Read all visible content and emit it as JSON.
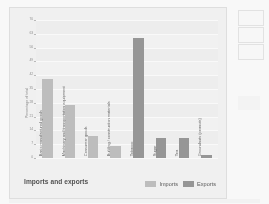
{
  "chart_data": {
    "type": "bar",
    "title": "Imports and exports",
    "xlabel": "",
    "ylabel": "Percentage of total",
    "ylim": [
      0,
      70
    ],
    "yticks": [
      0,
      7,
      14,
      21,
      28,
      35,
      42,
      49,
      56,
      63,
      70
    ],
    "grid": true,
    "legend_position": "bottom-right",
    "categories": [
      "Basic manufactured goods",
      "Machinery and transportation equipment",
      "Consumer goods",
      "Building / construction materials",
      "Tobacco",
      "Sugar",
      "Tea",
      "Groundnuts (peanuts)"
    ],
    "series": [
      {
        "name": "Imports",
        "color": "#b9b9b9",
        "values": [
          40,
          27,
          11,
          6,
          0,
          0,
          0,
          0
        ]
      },
      {
        "name": "Exports",
        "color": "#8d8d8d",
        "values": [
          0,
          0,
          0,
          0,
          61,
          10,
          10,
          1.5
        ]
      }
    ],
    "bars": [
      {
        "category": "Basic manufactured goods",
        "series": "Imports",
        "value": 40
      },
      {
        "category": "Machinery and transportation equipment",
        "series": "Imports",
        "value": 27
      },
      {
        "category": "Consumer goods",
        "series": "Imports",
        "value": 11
      },
      {
        "category": "Building / construction materials",
        "series": "Imports",
        "value": 6
      },
      {
        "category": "Tobacco",
        "series": "Exports",
        "value": 61
      },
      {
        "category": "Sugar",
        "series": "Exports",
        "value": 10
      },
      {
        "category": "Tea",
        "series": "Exports",
        "value": 10
      },
      {
        "category": "Groundnuts (peanuts)",
        "series": "Exports",
        "value": 1.5
      }
    ]
  },
  "legend": {
    "imports_label": "Imports",
    "exports_label": "Exports"
  },
  "colors": {
    "imports": "#b9b9b9",
    "exports": "#8d8d8d",
    "plot_background": "#efefef",
    "card_background": "#f2f2f2",
    "gridline": "#fdfdfd",
    "axis": "#c6c6c6",
    "tick_text": "#8a8a8a",
    "label_text": "#5a5a5a",
    "title_text": "#3f3f3f"
  }
}
